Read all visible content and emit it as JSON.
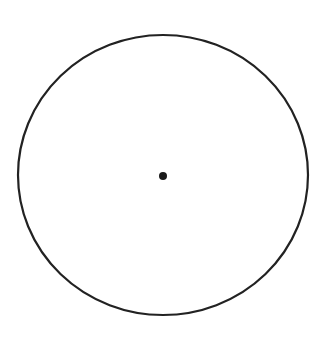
{
  "diagram": {
    "background": "#ffffff",
    "circle": {
      "cx": 163,
      "cy": 175,
      "rx": 145,
      "ry": 140,
      "stroke": "#222222",
      "stroke_width": 2.2
    },
    "center_point": {
      "cx": 163,
      "cy": 176,
      "r": 4,
      "fill": "#1a1a1a"
    }
  }
}
